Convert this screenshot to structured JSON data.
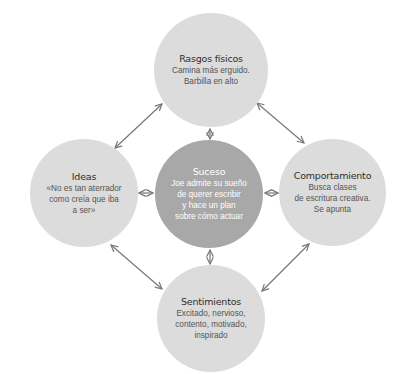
{
  "colors": {
    "background": "#ffffff",
    "outer_node": "#dcdcdc",
    "center_node": "#a8a8a8",
    "arrow": "#777777",
    "title_text": "#2e2e2e",
    "body_text": "#555555",
    "center_text": "#ffffff"
  },
  "nodes": {
    "center": {
      "title": "Suceso",
      "lines": [
        "Joe admite su sueño",
        "de querer escribir",
        "y hace un plan",
        "sobre cómo actuar"
      ]
    },
    "top": {
      "title": "Rasgos físicos",
      "lines": [
        "Camina más erguido.",
        "Barbilla en alto"
      ]
    },
    "left": {
      "title": "Ideas",
      "lines": [
        "«No es tan aterrador",
        "como creía que iba",
        "a ser»"
      ]
    },
    "right": {
      "title": "Comportamiento",
      "lines": [
        "Busca clases",
        "de escritura creativa.",
        "Se apunta"
      ]
    },
    "bottom": {
      "title": "Sentimientos",
      "lines": [
        "Excitado, nervioso,",
        "contento, motivado,",
        "inspirado"
      ]
    }
  },
  "connectors": [
    {
      "from": "top",
      "to": "center",
      "type": "double-arrow"
    },
    {
      "from": "left",
      "to": "center",
      "type": "double-arrow"
    },
    {
      "from": "right",
      "to": "center",
      "type": "double-arrow"
    },
    {
      "from": "bottom",
      "to": "center",
      "type": "double-arrow"
    },
    {
      "from": "left",
      "to": "top",
      "type": "double-arrow"
    },
    {
      "from": "top",
      "to": "right",
      "type": "double-arrow"
    },
    {
      "from": "left",
      "to": "bottom",
      "type": "double-arrow"
    },
    {
      "from": "bottom",
      "to": "right",
      "type": "double-arrow"
    }
  ]
}
